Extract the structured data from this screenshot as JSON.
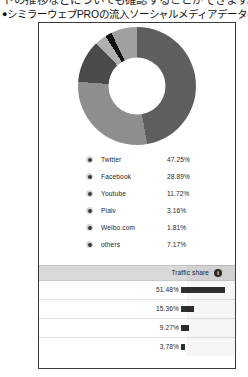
{
  "page": {
    "top_clipped_text": "ドの推移などについても確認することができます。",
    "caption_bullet": "●",
    "caption": "シミラーウェブPROの流入ソーシャルメディアデータの例"
  },
  "chart_data": {
    "type": "pie",
    "variant": "donut",
    "title": "",
    "labels": [
      "Twitter",
      "Facebook",
      "Youtube",
      "Pialv",
      "Weibo.com",
      "others"
    ],
    "values": [
      47.25,
      28.89,
      11.72,
      3.16,
      1.81,
      7.17
    ],
    "value_labels": [
      "47.25%",
      "28.89%",
      "11.72%",
      "3.16%",
      "1.81%",
      "7.17%"
    ],
    "colors": [
      "#5e5e5e",
      "#8e8e8e",
      "#4a4a4a",
      "#b0b0b0",
      "#121212",
      "#a0a0a0"
    ],
    "legend_position": "bottom"
  },
  "legend": {
    "items": [
      {
        "label": "Twitter",
        "value": "47.25%"
      },
      {
        "label": "Facebook",
        "value": "28.89%"
      },
      {
        "label": "Youtube",
        "value": "11.72%"
      },
      {
        "label": "Pialv",
        "value": "3.16%"
      },
      {
        "label": "Weibo.com",
        "value": "1.81%"
      },
      {
        "label": "others",
        "value": "7.17%"
      }
    ]
  },
  "table": {
    "header": {
      "label": "Traffic share",
      "info_icon": "info-icon",
      "info_glyph": "i"
    },
    "rows": [
      {
        "value": "51.48%",
        "pct": 51.48
      },
      {
        "value": "15.36%",
        "pct": 15.36
      },
      {
        "value": "9.27%",
        "pct": 9.27
      },
      {
        "value": "3.78%",
        "pct": 3.78
      }
    ]
  }
}
